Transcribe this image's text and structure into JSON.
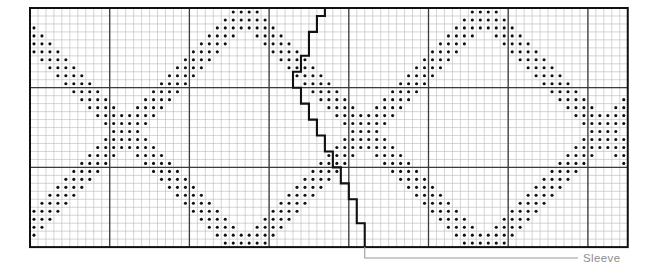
{
  "chart_data": {
    "type": "heatmap",
    "title": "",
    "subtitle": "",
    "xlabel": "",
    "ylabel": "",
    "grid": {
      "columns": 75,
      "rows": 30,
      "cell_px": 7.97,
      "origin_x": 30,
      "origin_y": 8,
      "bold_every_columns": 10,
      "bold_every_rows": 10,
      "grid_on": true,
      "fine_line_color": "#b9b9b9",
      "bold_line_color": "#3b3b3b",
      "frame_color": "#111111",
      "dot_color": "#101010",
      "background_color": "#ffffff"
    },
    "symbols": [
      {
        "key": "filled",
        "glyph": "dot",
        "meaning": "contrast colour stitch"
      },
      {
        "key": "empty",
        "glyph": "blank",
        "meaning": "main colour stitch"
      }
    ],
    "motif": {
      "name": "diagonal zig-zag lattice",
      "band_thickness_cells": 4,
      "repeat_width_cells": 30,
      "repeat_height_cells": 30,
      "phase_offset_cells": 5
    },
    "sleeve_edge": {
      "label": "Sleeve",
      "kind": "stepped-outline",
      "steps_cells": [
        [
          37,
          0
        ],
        [
          37,
          1
        ],
        [
          36,
          1
        ],
        [
          36,
          3
        ],
        [
          35,
          3
        ],
        [
          35,
          6
        ],
        [
          34,
          6
        ],
        [
          34,
          8
        ],
        [
          33,
          8
        ],
        [
          33,
          10
        ],
        [
          34,
          10
        ],
        [
          34,
          12
        ],
        [
          35,
          12
        ],
        [
          35,
          14
        ],
        [
          36,
          14
        ],
        [
          36,
          16
        ],
        [
          37,
          16
        ],
        [
          37,
          18
        ],
        [
          38,
          18
        ],
        [
          38,
          20
        ],
        [
          39,
          20
        ],
        [
          39,
          22
        ],
        [
          40,
          22
        ],
        [
          40,
          24
        ],
        [
          41,
          24
        ],
        [
          41,
          27
        ],
        [
          42,
          27
        ],
        [
          42,
          30
        ]
      ]
    }
  },
  "annotations": {
    "sleeve": {
      "label": "Sleeve",
      "color": "#8d8d8d",
      "leader_color": "#9a9a9a"
    }
  },
  "legend": {
    "position": "none",
    "entries": []
  }
}
